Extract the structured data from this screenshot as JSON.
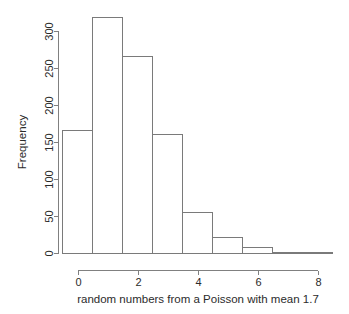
{
  "chart_data": {
    "type": "bar",
    "title": "",
    "subtitle": "",
    "xlabel": "random numbers from a Poisson with mean 1.7",
    "ylabel": "Frequency",
    "categories": [
      "0",
      "1",
      "2",
      "3",
      "4",
      "5",
      "6",
      "7",
      "8"
    ],
    "bin_edges": [
      -0.5,
      0.5,
      1.5,
      2.5,
      3.5,
      4.5,
      5.5,
      6.5,
      7.5,
      8.5
    ],
    "values": [
      166,
      318,
      266,
      161,
      55,
      21,
      8,
      2,
      2
    ],
    "x": [
      0,
      1,
      2,
      3,
      4,
      5,
      6,
      7,
      8
    ],
    "xlim": [
      -0.5,
      8.5
    ],
    "ylim": [
      0,
      320
    ],
    "xticks": [
      0,
      2,
      4,
      6,
      8
    ],
    "xtick_labels": [
      "0",
      "2",
      "4",
      "6",
      "8"
    ],
    "yticks": [
      0,
      50,
      100,
      150,
      200,
      250,
      300
    ],
    "ytick_labels": [
      "0",
      "50",
      "100",
      "150",
      "200",
      "250",
      "300"
    ],
    "grid": false,
    "legend": null,
    "bar_fill_color": "#ffffff",
    "bar_stroke_color": "#7a7a7a",
    "axis_color": "#808080",
    "text_color": "#2b2b2b",
    "background_color": "#ffffff"
  },
  "axes": {
    "y_label": "Frequency",
    "x_label": "random numbers from a Poisson with mean 1.7",
    "y_tick_0": "0",
    "y_tick_50": "50",
    "y_tick_100": "100",
    "y_tick_150": "150",
    "y_tick_200": "200",
    "y_tick_250": "250",
    "y_tick_300": "300",
    "x_tick_0": "0",
    "x_tick_2": "2",
    "x_tick_4": "4",
    "x_tick_6": "6",
    "x_tick_8": "8"
  }
}
